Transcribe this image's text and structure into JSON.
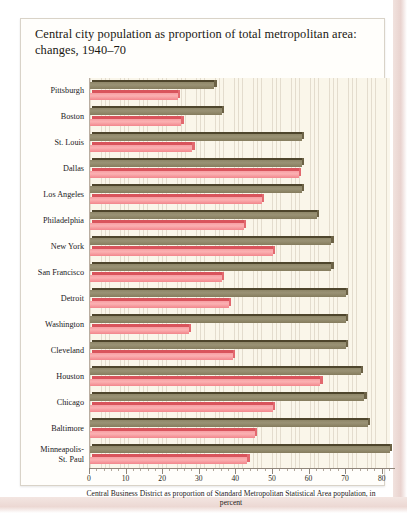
{
  "title": "Central city population as proportion of total metropolitan area: changes, 1940–70",
  "legend": {
    "items": [
      {
        "label": "1940",
        "color": "#8e8668",
        "icon": "cube-swatch-icon"
      },
      {
        "label": "1970",
        "color": "#f79fa3",
        "icon": "cube-swatch-icon"
      }
    ]
  },
  "axis_caption": "Central Business District as proportion of\nStandard Metropolitan Statistical Area population, in percent",
  "chart_data": {
    "type": "bar",
    "orientation": "horizontal",
    "title": "Central city population as proportion of total metropolitan area: changes, 1940–70",
    "xlabel": "Central Business District as proportion of Standard Metropolitan Statistical Area population, in percent",
    "ylabel": "",
    "xlim": [
      0,
      82
    ],
    "xticks": [
      0,
      10,
      20,
      30,
      40,
      50,
      60,
      70,
      80
    ],
    "xticklabels": [
      "0",
      "10",
      "20",
      "30",
      "40",
      "50",
      "60",
      "70",
      "80"
    ],
    "grid": "vertical-hairlines",
    "legend_position": "top-right",
    "categories": [
      "Pittsburgh",
      "Boston",
      "St. Louis",
      "Dallas",
      "Los Angeles",
      "Philadelphia",
      "New York",
      "San Francisco",
      "Detroit",
      "Washington",
      "Cleveland",
      "Houston",
      "Chicago",
      "Baltimore",
      "Minneapolis-\nSt. Paul"
    ],
    "series": [
      {
        "name": "1940",
        "color": "#8e8668",
        "values": [
          34,
          36,
          58,
          58,
          58,
          62,
          66,
          66,
          70,
          70,
          70,
          74,
          75,
          76,
          82
        ]
      },
      {
        "name": "1970",
        "color": "#f79fa3",
        "values": [
          24,
          25,
          28,
          57,
          47,
          42,
          50,
          36,
          38,
          27,
          39,
          63,
          50,
          45,
          43
        ]
      }
    ]
  }
}
